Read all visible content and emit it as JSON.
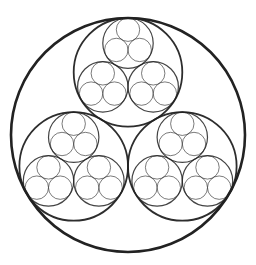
{
  "diagram": {
    "background": "#ffffff",
    "stroke_color": "#222222",
    "root": {
      "cx": 128,
      "cy": 135,
      "r": 117
    },
    "children_per_circle": 3,
    "child_radius_ratio": 0.4641,
    "depth": 3,
    "first_child_angle_deg": -90,
    "stroke_widths": [
      2.6,
      1.8,
      1.2,
      0.8
    ],
    "stroke_opacity": [
      1,
      0.95,
      0.85,
      0.75
    ]
  }
}
